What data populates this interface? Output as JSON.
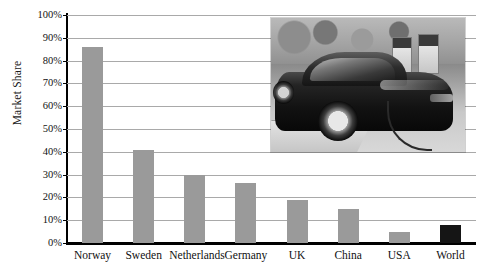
{
  "chart_data": {
    "type": "bar",
    "title": "",
    "xlabel": "",
    "ylabel": "Market Share",
    "categories": [
      "Norway",
      "Sweden",
      "Netherlands",
      "Germany",
      "UK",
      "China",
      "USA",
      "World"
    ],
    "values": [
      86,
      41,
      30,
      26.5,
      19,
      15,
      5,
      8
    ],
    "ylim": [
      0,
      100
    ],
    "ytick_labels": [
      "100%",
      "90%",
      "80%",
      "70%",
      "60%",
      "50%",
      "40%",
      "30%",
      "20%",
      "10%",
      "0%"
    ],
    "ytick_values": [
      100,
      90,
      80,
      70,
      60,
      50,
      40,
      30,
      20,
      10,
      0
    ],
    "grid": true,
    "legend": "none",
    "bar_colors": [
      "#9a9a9a",
      "#9a9a9a",
      "#9a9a9a",
      "#9a9a9a",
      "#9a9a9a",
      "#9a9a9a",
      "#9a9a9a",
      "#151515"
    ],
    "gridline_color": "#a9a9a9",
    "axis_color": "#000000",
    "background_color": "#ffffff"
  },
  "inset": {
    "name": "electric-car-charging-photo",
    "description": "Grayscale photo of a dark electric sedan plugged in at a charging station"
  }
}
